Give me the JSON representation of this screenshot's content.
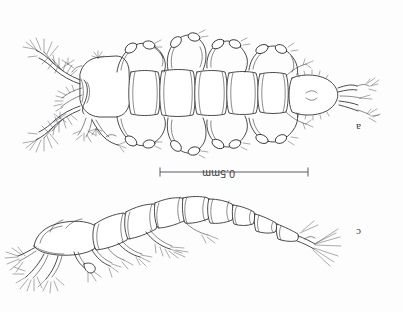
{
  "figure": {
    "kind": "scientific-line-drawing",
    "orientation_note": "plate printed inverted; labels and scale text appear rotated 180 degrees",
    "background_color": "#fdfdfd",
    "ink_color": "#2c2c30"
  },
  "panels": [
    {
      "id": "a",
      "label": "a",
      "view": "dorsal",
      "description": "whole animal, dorsal view with segmented prosome and urosome, paired swimming legs, antennules with setae, rounded anal somite bearing caudal rami"
    },
    {
      "id": "c",
      "label": "c",
      "view": "lateral",
      "description": "whole animal, lateral view, body arched with tapering urosome ending in caudal rami with long terminal setae"
    }
  ],
  "scale_bar": {
    "label": "0.5mm",
    "value": 0.5,
    "unit": "mm",
    "x_start_px": 160,
    "x_end_px": 308,
    "y_px": 172,
    "tick_height_px": 9
  }
}
